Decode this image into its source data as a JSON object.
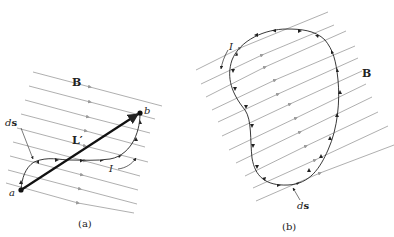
{
  "panel_a": {
    "caption": "(a)",
    "field_label": "B",
    "segment_label": "L′",
    "point_start": "a",
    "point_end": "b",
    "current_label": "I",
    "element_label_d": "d",
    "element_label_s": "s"
  },
  "panel_b": {
    "caption": "(b)",
    "field_label": "B",
    "current_label": "I",
    "element_label_d": "d",
    "element_label_s": "s"
  },
  "colors": {
    "field_line": "#9a9a9a",
    "wire": "#222222",
    "text": "#222222"
  }
}
